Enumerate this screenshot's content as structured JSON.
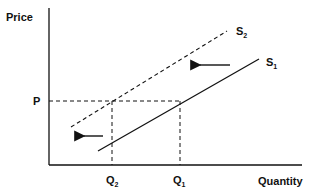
{
  "diagram": {
    "type": "supply-shift",
    "axes": {
      "y_label": "Price",
      "x_label": "Quantity"
    },
    "curves": [
      {
        "id": "S1",
        "label": "S",
        "subscript": "1",
        "style": "solid"
      },
      {
        "id": "S2",
        "label": "S",
        "subscript": "2",
        "style": "dashed"
      }
    ],
    "price_level": "P",
    "quantities": [
      {
        "id": "Q2",
        "label": "Q",
        "subscript": "2"
      },
      {
        "id": "Q1",
        "label": "Q",
        "subscript": "1"
      }
    ],
    "arrows": [
      {
        "direction": "left",
        "meaning": "supply curve shift left"
      },
      {
        "direction": "left",
        "meaning": "quantity decrease"
      }
    ],
    "colors": {
      "ink": "#111111",
      "background": "#ffffff"
    }
  }
}
